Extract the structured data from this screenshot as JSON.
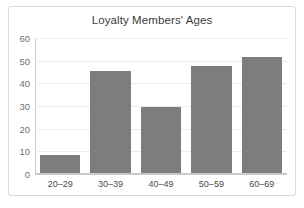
{
  "chart_data": {
    "type": "bar",
    "title": "Loyalty Members' Ages",
    "xlabel": "",
    "ylabel": "",
    "categories": [
      "20–29",
      "30–39",
      "40–49",
      "50–59",
      "60–69"
    ],
    "values": [
      8,
      45,
      29,
      47,
      51
    ],
    "yticks": [
      0,
      10,
      20,
      30,
      40,
      50,
      60
    ],
    "ytick_labels": [
      "0",
      "10",
      "20",
      "30",
      "40",
      "50",
      "60"
    ],
    "ylim": [
      0,
      60
    ],
    "grid": true,
    "legend": false,
    "legend_position": "none",
    "bar_color": "#7d7d7d",
    "gridline_color": "#ececec",
    "axis_color": "#c9c9c9",
    "title_color": "#3a3a3a",
    "ytick_color": "#6f6f6f",
    "xtick_color": "#4a4a4a",
    "border_color": "#d8d8d8",
    "background_color": "#ffffff"
  }
}
